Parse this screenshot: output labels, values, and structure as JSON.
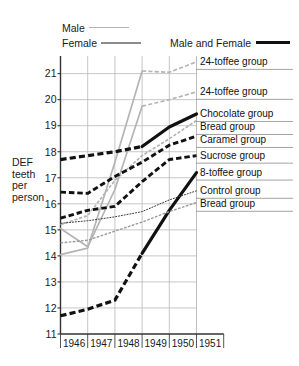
{
  "legend": {
    "male_label": "Male",
    "female_label": "Female",
    "both_label": "Male and Female"
  },
  "axis": {
    "ylabel_lines": [
      "DEF",
      "teeth",
      "per",
      "person"
    ],
    "ylabel_full": "DEF teeth per person"
  },
  "colors": {
    "male": "#b4b4b4",
    "female": "#8c8c8c",
    "both": "#111111",
    "grid": "#b9b9b9",
    "axis": "#333333",
    "text": "#1a1a1a"
  },
  "right_labels": [
    {
      "text": "24-toffee group"
    },
    {
      "text": "24-toffee group"
    },
    {
      "text": "Chocolate group"
    },
    {
      "text": "Bread group"
    },
    {
      "text": "Caramel group"
    },
    {
      "text": "Sucrose group"
    },
    {
      "text": "8-toffee group"
    },
    {
      "text": "Control group"
    },
    {
      "text": "Bread group"
    }
  ],
  "chart_data": {
    "type": "line",
    "title": "",
    "xlabel": "",
    "ylabel": "DEF teeth per person",
    "x": [
      1946,
      1947,
      1948,
      1949,
      1950,
      1951
    ],
    "xtick_labels": [
      "1946",
      "1947",
      "1948",
      "1949",
      "1950",
      "1951"
    ],
    "ylim": [
      11,
      21.6
    ],
    "yticks": [
      11,
      12,
      13,
      14,
      15,
      16,
      17,
      18,
      19,
      20,
      21
    ],
    "ytick_labels": [
      "11",
      "12",
      "13",
      "14",
      "15",
      "16",
      "17",
      "18",
      "19",
      "20",
      "21"
    ],
    "grid": true,
    "legend_position": "top",
    "series": [
      {
        "name": "24-toffee group (Male)",
        "group": "24-toffee group",
        "sex": "Male",
        "color": "#b4b4b4",
        "style": "solid-then-dashed",
        "width": 1.7,
        "values": [
          14.05,
          14.3,
          17.6,
          21.1,
          21.05,
          21.45
        ],
        "right_label": "24-toffee group",
        "right_label_index": 0
      },
      {
        "name": "24-toffee group (Female)",
        "group": "24-toffee group",
        "sex": "Female",
        "color": "#b4b4b4",
        "style": "solid-then-dashed",
        "width": 1.7,
        "values": [
          15.05,
          14.35,
          16.55,
          19.75,
          20.0,
          20.3
        ],
        "right_label": "24-toffee group",
        "right_label_index": 1
      },
      {
        "name": "Chocolate group",
        "group": "Chocolate group",
        "sex": "Male and Female",
        "color": "#111111",
        "style": "dashed-then-solid",
        "width": 3.2,
        "values": [
          17.7,
          17.85,
          18.0,
          18.2,
          18.95,
          19.45
        ],
        "right_label": "Chocolate group",
        "right_label_index": 2
      },
      {
        "name": "Bread group (upper, Male)",
        "group": "Bread group",
        "sex": "Male",
        "color": "#b4b4b4",
        "style": "dashed",
        "width": 1.7,
        "values": [
          15.2,
          15.55,
          16.9,
          17.85,
          18.5,
          19.2
        ],
        "right_label": "Bread group",
        "right_label_index": 3
      },
      {
        "name": "Caramel group",
        "group": "Caramel group",
        "sex": "Male and Female",
        "color": "#111111",
        "style": "dashed",
        "width": 2.9,
        "values": [
          16.45,
          16.4,
          17.05,
          17.6,
          18.25,
          18.6
        ],
        "right_label": "Caramel group",
        "right_label_index": 4
      },
      {
        "name": "Sucrose group",
        "group": "Sucrose group",
        "sex": "Male and Female",
        "color": "#111111",
        "style": "dashed",
        "width": 2.9,
        "values": [
          15.45,
          15.75,
          15.9,
          16.85,
          17.7,
          17.85
        ],
        "right_label": "Sucrose group",
        "right_label_index": 5
      },
      {
        "name": "8-toffee group",
        "group": "8-toffee group",
        "sex": "Male and Female",
        "color": "#111111",
        "style": "dashed-then-solid",
        "width": 3.2,
        "values": [
          11.7,
          11.95,
          12.3,
          14.1,
          15.75,
          17.2
        ],
        "right_label": "8-toffee group",
        "right_label_index": 6
      },
      {
        "name": "Control group",
        "group": "Control group",
        "sex": "Male",
        "color": "#3a3a3a",
        "style": "dashed",
        "width": 1.0,
        "values": [
          15.25,
          15.35,
          15.5,
          15.7,
          16.15,
          16.5
        ],
        "right_label": "Control group",
        "right_label_index": 7
      },
      {
        "name": "Bread group (lower, Female)",
        "group": "Bread group",
        "sex": "Female",
        "color": "#9a9a9a",
        "style": "dashed",
        "width": 1.4,
        "values": [
          14.5,
          14.6,
          14.95,
          15.3,
          15.7,
          16.05
        ],
        "right_label": "Bread group",
        "right_label_index": 8
      }
    ]
  }
}
